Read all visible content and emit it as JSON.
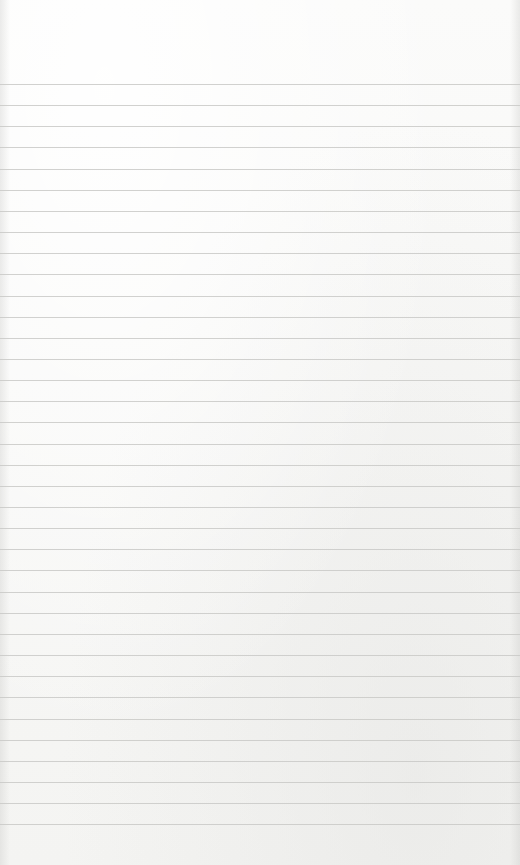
{
  "paper": {
    "type": "lined-notepad",
    "background_color": "#f6f6f4",
    "line_color": "#c9c9c7",
    "first_line_y": 84,
    "line_spacing": 21.15,
    "line_count": 36,
    "text": ""
  }
}
